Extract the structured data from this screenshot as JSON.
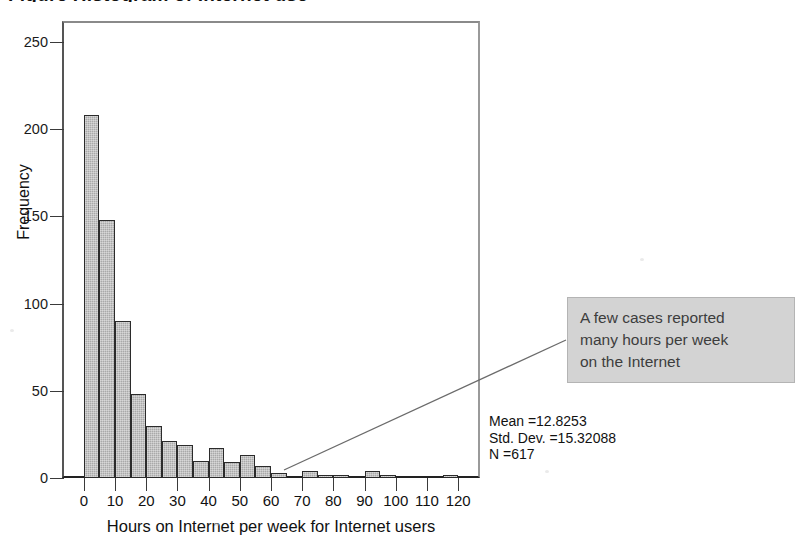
{
  "figure": {
    "title_clipped": "Figure   Histogram  of  Internet  use",
    "background_color": "#ffffff"
  },
  "stats": {
    "lines": "Mean =12.8253\nStd. Dev. =15.32088\nN =617",
    "mean_label": "Mean =12.8253",
    "std_dev_label": "Std. Dev. =15.32088",
    "n_label": "N =617"
  },
  "callout": {
    "text": "A few cases reported\nmany hours per week\non the Internet",
    "fill_color": "#d3d3d3",
    "text_color": "#3d3d3d"
  },
  "chart_data": {
    "type": "bar",
    "title": "",
    "subtitle": "",
    "xlabel": "Hours on Internet per week for Internet users",
    "ylabel": "Frequency",
    "xlim": [
      -7,
      127
    ],
    "ylim": [
      0,
      262
    ],
    "xticks": [
      0,
      10,
      20,
      30,
      40,
      50,
      60,
      70,
      80,
      90,
      100,
      110,
      120
    ],
    "xtick_labels": [
      "0",
      "10",
      "20",
      "30",
      "40",
      "50",
      "60",
      "70",
      "80",
      "90",
      "100",
      "110",
      "120"
    ],
    "yticks": [
      0,
      50,
      100,
      150,
      200,
      250
    ],
    "ytick_labels": [
      "0",
      "50",
      "100",
      "150",
      "200",
      "250"
    ],
    "grid": false,
    "legend": false,
    "bin_width": 5,
    "bin_starts": [
      0,
      5,
      10,
      15,
      20,
      25,
      30,
      35,
      40,
      45,
      50,
      55,
      60,
      65,
      70,
      75,
      80,
      85,
      90,
      95,
      100,
      105,
      110,
      115
    ],
    "bin_labels": [
      "0-5",
      "5-10",
      "10-15",
      "15-20",
      "20-25",
      "25-30",
      "30-35",
      "35-40",
      "40-45",
      "45-50",
      "50-55",
      "55-60",
      "60-65",
      "65-70",
      "70-75",
      "75-80",
      "80-85",
      "85-90",
      "90-95",
      "95-100",
      "100-105",
      "105-110",
      "110-115",
      "115-120"
    ],
    "values": [
      208,
      148,
      90,
      48,
      30,
      21,
      19,
      10,
      17,
      9,
      13,
      7,
      3,
      0,
      4,
      1,
      1,
      0,
      4,
      2,
      0,
      0,
      0,
      2
    ],
    "bar_face_color": "#a9a9a9",
    "bar_edge_color": "#2b2b2b",
    "summary": {
      "mean": 12.8253,
      "std_dev": 15.32088,
      "n": 617
    }
  }
}
